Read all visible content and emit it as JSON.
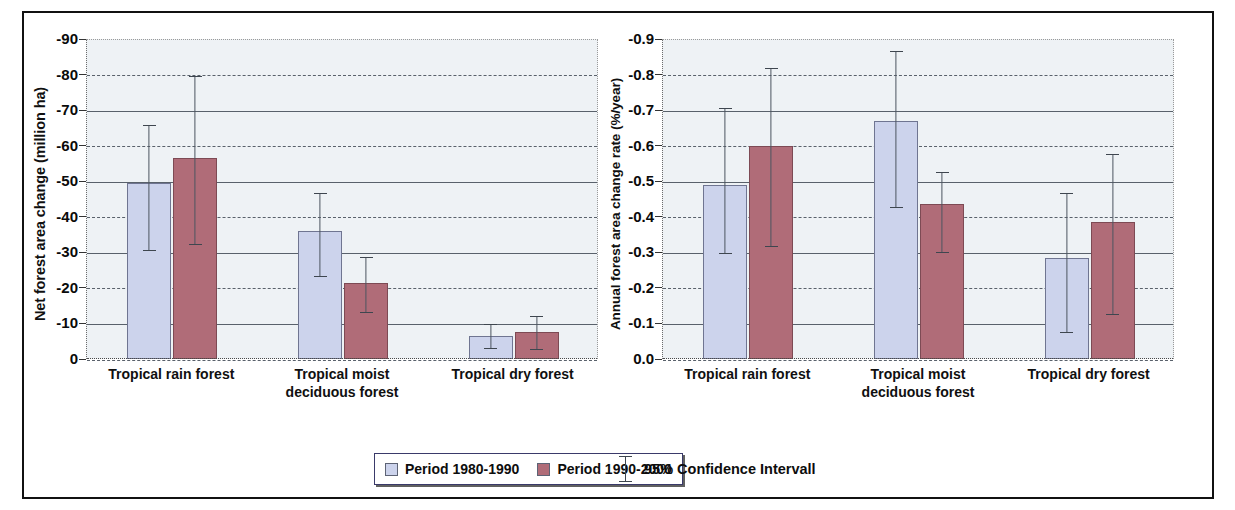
{
  "figure": {
    "border_color": "#111111",
    "plot_background": "#eef2f5",
    "series_colors": {
      "period1": "#ccd3ec",
      "period2": "#b06c78"
    }
  },
  "legend": {
    "period1_label": "Period 1980-1990",
    "period2_label": "Period 1990-2000",
    "ci_label": "95% Confidence Intervall",
    "swatch1_name": "period-1980-1990-swatch",
    "swatch2_name": "period-1990-2000-swatch"
  },
  "chart_data": [
    {
      "type": "bar",
      "panel": "left",
      "title": "",
      "xlabel": "",
      "ylabel": "Net forest area change (million ha)",
      "ylim": [
        -90,
        0
      ],
      "yticks": [
        "-90",
        "-80",
        "-70",
        "-60",
        "-50",
        "-40",
        "-30",
        "-20",
        "-10",
        "0"
      ],
      "ytick_values": [
        -90,
        -80,
        -70,
        -60,
        -50,
        -40,
        -30,
        -20,
        -10,
        0
      ],
      "grid": true,
      "legend_position": "bottom",
      "categories": [
        "Tropical rain forest",
        "Tropical moist deciduous forest",
        "Tropical dry forest"
      ],
      "category_lines": [
        [
          "Tropical rain forest"
        ],
        [
          "Tropical moist",
          "deciduous forest"
        ],
        [
          "Tropical dry forest"
        ]
      ],
      "series": [
        {
          "name": "Period 1980-1990",
          "color": "#ccd3ec",
          "values": [
            -49.5,
            -36.0,
            -6.5
          ],
          "ci_low": [
            -66.0,
            -47.0,
            -10.0
          ],
          "ci_high": [
            -31.0,
            -23.5,
            -3.5
          ]
        },
        {
          "name": "Period 1990-2000",
          "color": "#b06c78",
          "values": [
            -56.5,
            -21.5,
            -7.5
          ],
          "ci_low": [
            -80.0,
            -29.0,
            -12.5
          ],
          "ci_high": [
            -32.5,
            -13.5,
            -3.0
          ]
        }
      ]
    },
    {
      "type": "bar",
      "panel": "right",
      "title": "",
      "xlabel": "",
      "ylabel": "Annual forest area change rate (%/year)",
      "ylim": [
        -0.9,
        0.0
      ],
      "yticks": [
        "-0.9",
        "-0.8",
        "-0.7",
        "-0.6",
        "-0.5",
        "-0.4",
        "-0.3",
        "-0.2",
        "-0.1",
        "0.0"
      ],
      "ytick_values": [
        -0.9,
        -0.8,
        -0.7,
        -0.6,
        -0.5,
        -0.4,
        -0.3,
        -0.2,
        -0.1,
        0.0
      ],
      "grid": true,
      "legend_position": "bottom",
      "categories": [
        "Tropical rain forest",
        "Tropical moist deciduous forest",
        "Tropical dry forest"
      ],
      "category_lines": [
        [
          "Tropical rain forest"
        ],
        [
          "Tropical moist",
          "deciduous forest"
        ],
        [
          "Tropical dry forest"
        ]
      ],
      "series": [
        {
          "name": "Period 1980-1990",
          "color": "#ccd3ec",
          "values": [
            -0.49,
            -0.67,
            -0.285
          ],
          "ci_low": [
            -0.71,
            -0.87,
            -0.47
          ],
          "ci_high": [
            -0.3,
            -0.43,
            -0.08
          ]
        },
        {
          "name": "Period 1990-2000",
          "color": "#b06c78",
          "values": [
            -0.6,
            -0.435,
            -0.385
          ],
          "ci_low": [
            -0.82,
            -0.53,
            -0.58
          ],
          "ci_high": [
            -0.32,
            -0.305,
            -0.13
          ]
        }
      ]
    }
  ]
}
